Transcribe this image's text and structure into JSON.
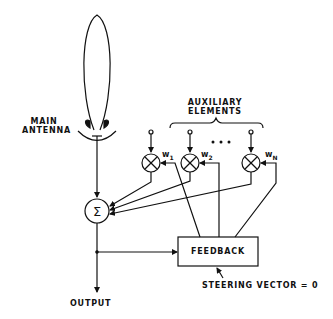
{
  "diagram": {
    "labels": {
      "main_antenna_line1": "MAIN",
      "main_antenna_line2": "ANTENNA",
      "auxiliary_line1": "AUXILIARY",
      "auxiliary_line2": "ELEMENTS",
      "summer": "Σ",
      "feedback": "FEEDBACK",
      "output": "OUTPUT",
      "steering_vector": "STEERING VECTOR = 0",
      "ellipsis": "• • •"
    },
    "weights": [
      {
        "name": "w",
        "sub": "1"
      },
      {
        "name": "w",
        "sub": "2"
      },
      {
        "name": "w",
        "sub": "N"
      }
    ],
    "nodes": [
      {
        "id": "main-antenna",
        "type": "antenna-with-beam"
      },
      {
        "id": "aux-1",
        "type": "multiplier"
      },
      {
        "id": "aux-2",
        "type": "multiplier"
      },
      {
        "id": "aux-N",
        "type": "multiplier"
      },
      {
        "id": "summer",
        "type": "sum"
      },
      {
        "id": "feedback",
        "type": "block"
      }
    ],
    "edges": [
      {
        "from": "main-antenna",
        "to": "summer"
      },
      {
        "from": "aux-1",
        "to": "summer"
      },
      {
        "from": "aux-2",
        "to": "summer"
      },
      {
        "from": "aux-N",
        "to": "summer"
      },
      {
        "from": "summer",
        "to": "output"
      },
      {
        "from": "summer",
        "to": "feedback"
      },
      {
        "from": "feedback",
        "to": "aux-1",
        "label": "w1"
      },
      {
        "from": "feedback",
        "to": "aux-2",
        "label": "w2"
      },
      {
        "from": "feedback",
        "to": "aux-N",
        "label": "wN"
      }
    ]
  }
}
